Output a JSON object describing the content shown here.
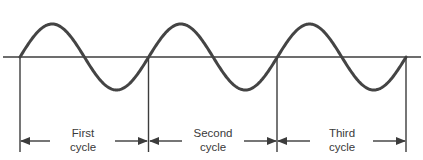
{
  "diagram": {
    "type": "sine-wave-cycles",
    "colors": {
      "wave": "#444444",
      "axis": "#3c3c3c",
      "text": "#3a3a3a",
      "background": "#ffffff"
    },
    "wave": {
      "cycles_drawn": 3,
      "start_x": 20,
      "period_px": 128.7,
      "baseline_y": 57,
      "amplitude_px": 33
    },
    "cycles": [
      {
        "line1": "First",
        "line2": "cycle"
      },
      {
        "line1": "Second",
        "line2": "cycle"
      },
      {
        "line1": "Third",
        "line2": "cycle"
      }
    ]
  }
}
